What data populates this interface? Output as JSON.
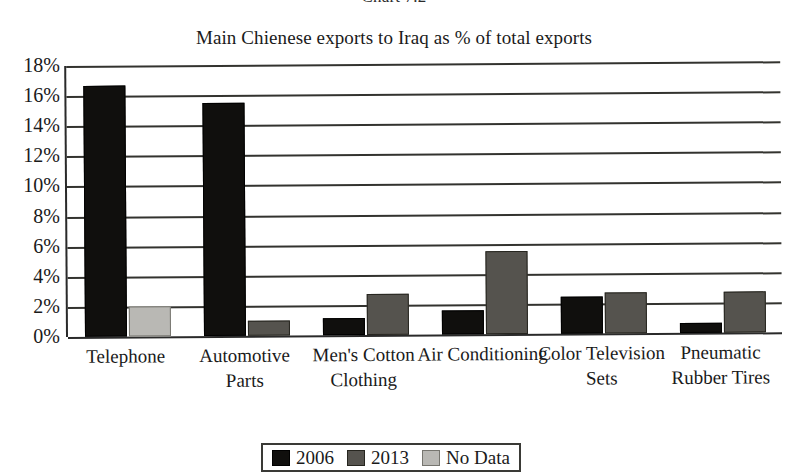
{
  "figure": {
    "number_label": "Chart 7.2"
  },
  "chart_data": {
    "type": "bar",
    "title": "Main Chienese exports to Iraq as % of total exports",
    "xlabel": "",
    "ylabel": "",
    "ylim": [
      0,
      18
    ],
    "ytick_labels": [
      "18%",
      "16%",
      "14%",
      "12%",
      "10%",
      "8%",
      "6%",
      "4%",
      "2%",
      "0%"
    ],
    "ytick_values": [
      18,
      16,
      14,
      12,
      10,
      8,
      6,
      4,
      2,
      0
    ],
    "grid": true,
    "legend_position": "bottom",
    "categories": [
      "Telephone",
      "Automotive Parts",
      "Men's Cotton Clothing",
      "Air Conditioning",
      "Color Television Sets",
      "Pneumatic Rubber Tires"
    ],
    "series": [
      {
        "name": "2006",
        "color": "#100f0d",
        "values": [
          16.7,
          15.5,
          1.1,
          1.6,
          2.45,
          0.65
        ]
      },
      {
        "name": "2013",
        "color": "#55534e",
        "values": [
          null,
          1.0,
          2.7,
          5.5,
          2.7,
          2.7
        ]
      },
      {
        "name": "No Data",
        "color": "#b9b8b4",
        "values": [
          2.0,
          null,
          null,
          null,
          null,
          null
        ]
      }
    ],
    "legend": [
      {
        "label": "2006",
        "swatch": "s2006"
      },
      {
        "label": "2013",
        "swatch": "s2013"
      },
      {
        "label": "No Data",
        "swatch": "nodata"
      }
    ]
  }
}
